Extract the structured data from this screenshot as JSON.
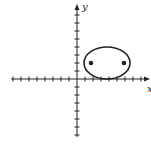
{
  "figure": {
    "type": "ellipse-on-coordinate-plane",
    "axes": {
      "x_label": "x",
      "y_label": "y",
      "origin_px": [
        77,
        79
      ],
      "unit_px": 8,
      "x_ticks_left": 8,
      "x_ticks_right": 8,
      "y_ticks_up": 8,
      "y_ticks_down": 7
    },
    "ellipse": {
      "center_px": [
        107,
        63
      ],
      "rx_px": 23,
      "ry_px": 16,
      "tangent_to_x_axis": true
    },
    "points": [
      {
        "label": "focus-left",
        "px": [
          91,
          63
        ]
      },
      {
        "label": "focus-right",
        "px": [
          124,
          63
        ]
      }
    ],
    "colors": {
      "stroke": "#222222",
      "background": "#ffffff"
    }
  }
}
